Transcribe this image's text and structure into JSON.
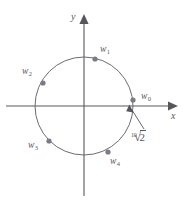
{
  "figure": {
    "background_color": "#ffffff",
    "ink_color": "#58565c",
    "point_color": "#7d7a86"
  },
  "axes": {
    "x_label": "x",
    "y_label": "y",
    "origin": {
      "x": 84,
      "y": 106
    },
    "x_axis": {
      "x1": 6,
      "y1": 106,
      "x2": 176,
      "y2": 106
    },
    "y_axis": {
      "x1": 84,
      "y1": 196,
      "x2": 84,
      "y2": 16
    },
    "arrowheads": [
      "x-positive",
      "y-positive"
    ]
  },
  "circle": {
    "center_x": 84,
    "center_y": 106,
    "radius": 49,
    "stroke_color": "#6d6a73",
    "stroke_width": 1
  },
  "points": [
    {
      "label": "w",
      "subscript": "0",
      "name": "w0",
      "cx": 133,
      "cy": 100,
      "label_x": 141,
      "label_y": 92
    },
    {
      "label": "w",
      "subscript": "1",
      "name": "w1",
      "cx": 95,
      "cy": 59,
      "label_x": 100,
      "label_y": 46
    },
    {
      "label": "w",
      "subscript": "2",
      "name": "w2",
      "cx": 43,
      "cy": 83,
      "label_x": 22,
      "label_y": 68
    },
    {
      "label": "w",
      "subscript": "3",
      "name": "w3",
      "cx": 49,
      "cy": 141,
      "label_x": 28,
      "label_y": 142
    },
    {
      "label": "w",
      "subscript": "4",
      "name": "w4",
      "cx": 108,
      "cy": 152,
      "label_x": 110,
      "label_y": 157
    }
  ],
  "radius_annotation": {
    "index": "10",
    "radicand": "2",
    "label_x": 131,
    "label_y": 130,
    "arrow": {
      "x1": 144,
      "y1": 128,
      "x2": 130,
      "y2": 108
    }
  }
}
